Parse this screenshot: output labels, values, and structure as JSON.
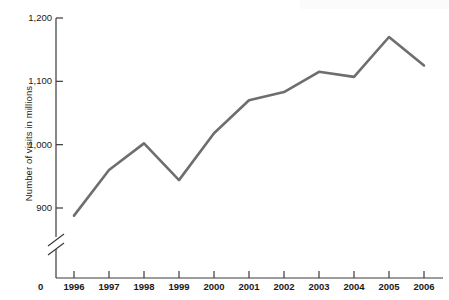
{
  "chart_data": {
    "type": "line",
    "title": "",
    "xlabel": "",
    "ylabel": "Number of visits in millions",
    "categories": [
      "1996",
      "1997",
      "1998",
      "1999",
      "2000",
      "2001",
      "2002",
      "2003",
      "2004",
      "2005",
      "2006"
    ],
    "values": [
      888,
      960,
      1002,
      944,
      1018,
      1070,
      1083,
      1115,
      1107,
      1170,
      1125
    ],
    "series": [
      {
        "name": "Number of visits",
        "values": [
          888,
          960,
          1002,
          944,
          1018,
          1070,
          1083,
          1115,
          1107,
          1170,
          1125
        ]
      }
    ],
    "ylim": [
      880,
      1200
    ],
    "yticks": [
      "900",
      "1,000",
      "1,100",
      "1,200"
    ],
    "ytick_values": [
      900,
      1000,
      1100,
      1200
    ],
    "origin_label": "0",
    "axis_break": true,
    "grid": false,
    "legend": "none",
    "line_color": "#6e6e6e",
    "axis_color": "#3a3a3a"
  },
  "axis": {
    "y_label": "Number of visits in millions",
    "origin": "0"
  }
}
